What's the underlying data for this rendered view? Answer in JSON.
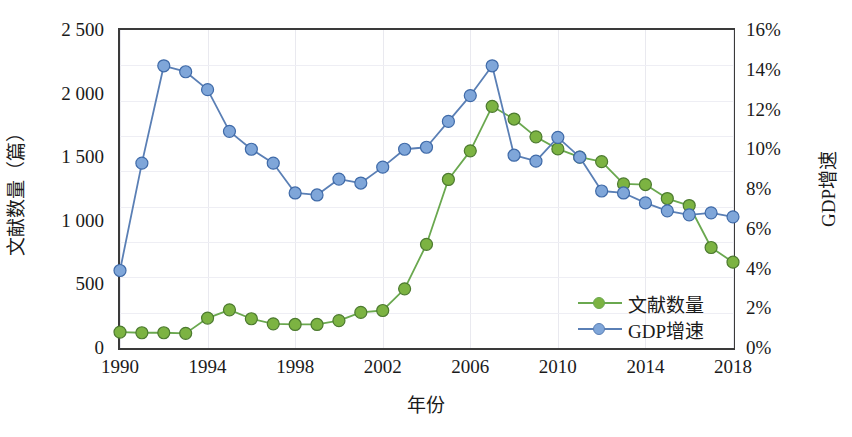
{
  "chart_data": {
    "type": "line",
    "title": "",
    "xlabel": "年份",
    "ylabel": "文献数量（篇）",
    "ylabel_right": "GDP增速",
    "grid": true,
    "legend_position": "inside-bottom-right",
    "x": [
      1990,
      1991,
      1992,
      1993,
      1994,
      1995,
      1996,
      1997,
      1998,
      1999,
      2000,
      2001,
      2002,
      2003,
      2004,
      2005,
      2006,
      2007,
      2008,
      2009,
      2010,
      2011,
      2012,
      2013,
      2014,
      2015,
      2016,
      2017,
      2018
    ],
    "xlim": [
      1990,
      2018
    ],
    "xticks": [
      1990,
      1994,
      1998,
      2002,
      2006,
      2010,
      2014,
      2018
    ],
    "xticklabels": [
      "1990",
      "1994",
      "1998",
      "2002",
      "2006",
      "2010",
      "2014",
      "2018"
    ],
    "ylim": [
      0,
      2500
    ],
    "yticks": [
      0,
      500,
      1000,
      1500,
      2000,
      2500
    ],
    "yticklabels": [
      "0",
      "500",
      "1 000",
      "1 500",
      "2 000",
      "2 500"
    ],
    "ylim_right": [
      0,
      16
    ],
    "yticks_right": [
      0,
      2,
      4,
      6,
      8,
      10,
      12,
      14,
      16
    ],
    "yticklabels_right": [
      "0%",
      "2%",
      "4%",
      "6%",
      "8%",
      "10%",
      "12%",
      "14%",
      "16%"
    ],
    "series": [
      {
        "name": "文献数量",
        "axis": "left",
        "color": "#6aa84f",
        "marker_fill": "#7cb342",
        "marker_edge": "#4c7a2f",
        "values": [
          125,
          120,
          120,
          115,
          235,
          300,
          230,
          190,
          185,
          185,
          215,
          280,
          295,
          465,
          815,
          1325,
          1550,
          1900,
          1800,
          1660,
          1565,
          1500,
          1465,
          1290,
          1285,
          1175,
          1120,
          790,
          675
        ]
      },
      {
        "name": "GDP增速",
        "axis": "right",
        "color": "#5a7fb5",
        "marker_fill": "#7fa6d9",
        "marker_edge": "#3f6aa8",
        "values": [
          3.9,
          9.3,
          14.2,
          13.9,
          13.0,
          10.9,
          10.0,
          9.3,
          7.8,
          7.7,
          8.5,
          8.3,
          9.1,
          10.0,
          10.1,
          11.4,
          12.7,
          14.2,
          9.7,
          9.4,
          10.6,
          9.6,
          7.9,
          7.8,
          7.3,
          6.9,
          6.7,
          6.8,
          6.6
        ]
      }
    ]
  },
  "axes": {
    "left_title": "文献数量（篇）",
    "right_title": "GDP增速",
    "bottom_title": "年份"
  },
  "legend": {
    "items": [
      {
        "label": "文献数量",
        "color": "#6aa84f",
        "dot": "#7cb342"
      },
      {
        "label": "GDP增速",
        "color": "#5a7fb5",
        "dot": "#7fa6d9"
      }
    ]
  }
}
